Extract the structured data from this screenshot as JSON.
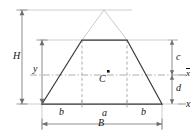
{
  "figure": {
    "centroid_label": "C",
    "colors": {
      "outline": "#3a3a3a",
      "construction": "#b4b4b4",
      "dimension": "#6e6e6e",
      "dashed": "#9a9a9a",
      "text": "#141414",
      "background": "#ffffff"
    },
    "labels": {
      "height_total": "H",
      "height_trapezoid": "y",
      "top_offset": "c",
      "bottom_offset": "d",
      "base_total": "B",
      "base_left_segment": "b",
      "base_middle_segment": "a",
      "base_right_segment": "b",
      "axis_centroidal": "x",
      "axis_base": "x"
    },
    "geometry": {
      "apex": [
        104,
        10
      ],
      "top_left": [
        82,
        40
      ],
      "top_right": [
        127,
        40
      ],
      "bottom_left": [
        42,
        104
      ],
      "bottom_right": [
        162,
        104
      ],
      "centroid": [
        104,
        75
      ]
    },
    "dimension_lines": [
      {
        "name": "H",
        "orientation": "vertical",
        "from": [
          22,
          10
        ],
        "to": [
          22,
          104
        ]
      },
      {
        "name": "y",
        "orientation": "vertical",
        "from": [
          42,
          40
        ],
        "to": [
          42,
          104
        ]
      },
      {
        "name": "c",
        "orientation": "vertical",
        "from": [
          172,
          40
        ],
        "to": [
          172,
          75
        ]
      },
      {
        "name": "d",
        "orientation": "vertical",
        "from": [
          172,
          75
        ],
        "to": [
          172,
          104
        ]
      },
      {
        "name": "B",
        "orientation": "horizontal",
        "from": [
          42,
          124
        ],
        "to": [
          162,
          124
        ]
      }
    ]
  }
}
